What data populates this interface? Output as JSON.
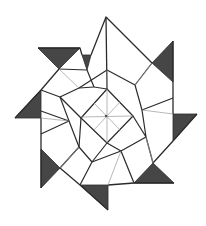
{
  "figure": {
    "colors": {
      "background": "#ffffff",
      "line": "#2b2b2b",
      "fold_line": "#9a9a9a",
      "flap_fill": "#464646"
    },
    "center": [
      106,
      116
    ],
    "symmetry": "8-fold rotational",
    "inner_square": {
      "vertices": [
        [
          107,
          89
        ],
        [
          133,
          116
        ],
        [
          107,
          143
        ],
        [
          81,
          118
        ]
      ],
      "center_dot": [
        106,
        116
      ]
    },
    "tips": [
      {
        "name": "top",
        "point": [
          106,
          17
        ]
      },
      {
        "name": "upper-right",
        "point": [
          173,
          41
        ]
      },
      {
        "name": "right",
        "point": [
          197,
          114
        ]
      },
      {
        "name": "lower-right",
        "point": [
          174,
          183
        ]
      },
      {
        "name": "bottom",
        "point": [
          108,
          210
        ]
      },
      {
        "name": "lower-left",
        "point": [
          41,
          188
        ]
      },
      {
        "name": "left",
        "point": [
          15,
          118
        ]
      },
      {
        "name": "upper-left",
        "point": [
          38,
          48
        ]
      }
    ],
    "dark_flaps": [
      {
        "name": "upper-left",
        "points": [
          [
            38,
            48
          ],
          [
            80,
            48
          ],
          [
            59,
            69
          ]
        ]
      },
      {
        "name": "upper-left-small",
        "points": [
          [
            82,
            55
          ],
          [
            91,
            55
          ],
          [
            87,
            70
          ]
        ]
      },
      {
        "name": "upper-right",
        "points": [
          [
            173,
            41
          ],
          [
            152,
            63
          ],
          [
            173,
            82
          ]
        ]
      },
      {
        "name": "right",
        "points": [
          [
            173,
            114
          ],
          [
            197,
            114
          ],
          [
            173,
            141
          ]
        ]
      },
      {
        "name": "lower-right",
        "points": [
          [
            153,
            163
          ],
          [
            134,
            183
          ],
          [
            174,
            183
          ]
        ]
      },
      {
        "name": "bottom",
        "points": [
          [
            80,
            185
          ],
          [
            108,
            185
          ],
          [
            108,
            210
          ]
        ]
      },
      {
        "name": "lower-left",
        "points": [
          [
            41,
            149
          ],
          [
            60,
            168
          ],
          [
            41,
            188
          ]
        ]
      },
      {
        "name": "left",
        "points": [
          [
            41,
            90
          ],
          [
            15,
            118
          ],
          [
            41,
            118
          ]
        ]
      }
    ]
  }
}
